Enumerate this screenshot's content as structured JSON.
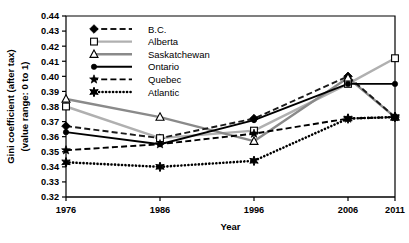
{
  "chart_data": {
    "type": "line",
    "title": "",
    "xlabel": "Year",
    "ylabel": "Gini coefficient (after tax) (value range: 0 to 1)",
    "ylabel_line1": "Gini coefficient (after tax)",
    "ylabel_line2": "(value range: 0 to 1)",
    "x": [
      1976,
      1986,
      1996,
      2006,
      2011
    ],
    "categories": [
      "1976",
      "1986",
      "1996",
      "2006",
      "2011"
    ],
    "ylim": [
      0.32,
      0.44
    ],
    "ytick_labels": [
      "0.44",
      "0.43",
      "0.42",
      "0.41",
      "0.40",
      "0.39",
      "0.38",
      "0.37",
      "0.36",
      "0.35",
      "0.34",
      "0.33",
      "0.32"
    ],
    "ytick_values": [
      0.44,
      0.43,
      0.42,
      0.41,
      0.4,
      0.39,
      0.38,
      0.37,
      0.36,
      0.35,
      0.34,
      0.33,
      0.32
    ],
    "grid": false,
    "legend_position": "top-left inside",
    "series": [
      {
        "name": "B.C.",
        "values": [
          0.367,
          0.359,
          0.372,
          0.4,
          0.373
        ],
        "line_style": "dashed",
        "color": "#1a1a1a",
        "marker": "diamond-filled"
      },
      {
        "name": "Alberta",
        "values": [
          0.38,
          0.359,
          0.364,
          0.395,
          0.412
        ],
        "line_style": "solid",
        "color": "#b0b0b0",
        "marker": "square-open"
      },
      {
        "name": "Saskatchewan",
        "values": [
          0.385,
          0.373,
          0.357,
          0.399,
          0.373
        ],
        "line_style": "solid",
        "color": "#8a8a8a",
        "marker": "triangle-open"
      },
      {
        "name": "Ontario",
        "values": [
          0.363,
          0.355,
          0.371,
          0.395,
          0.395
        ],
        "line_style": "solid",
        "color": "#000000",
        "marker": "circle-filled"
      },
      {
        "name": "Quebec",
        "values": [
          0.351,
          0.355,
          0.362,
          0.372,
          0.373
        ],
        "line_style": "dashed",
        "color": "#000000",
        "marker": "star"
      },
      {
        "name": "Atlantic",
        "values": [
          0.343,
          0.34,
          0.344,
          0.372,
          0.373
        ],
        "line_style": "dotted",
        "color": "#000000",
        "marker": "star-bold"
      }
    ]
  }
}
